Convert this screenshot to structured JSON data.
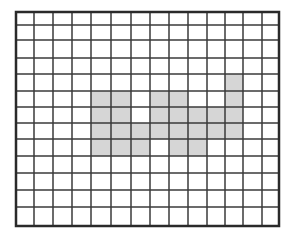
{
  "diagram": {
    "type": "grid",
    "columns": 14,
    "rows": 13,
    "x_lines": [
      16,
      34,
      53,
      72,
      91,
      111,
      131,
      150,
      169,
      188,
      207,
      225,
      243,
      262,
      279
    ],
    "y_lines": [
      12,
      25,
      40,
      58,
      74,
      91,
      107,
      123,
      139,
      156,
      173,
      190,
      207,
      226
    ],
    "line_color": "#3a3a3a",
    "border_color": "#2a2a2a",
    "fill_color": "#d6d6d6",
    "background": "#ffffff",
    "shaded_cells": [
      [
        4,
        11
      ],
      [
        5,
        4
      ],
      [
        5,
        5
      ],
      [
        5,
        7
      ],
      [
        5,
        8
      ],
      [
        5,
        11
      ],
      [
        6,
        4
      ],
      [
        6,
        5
      ],
      [
        6,
        7
      ],
      [
        6,
        8
      ],
      [
        6,
        9
      ],
      [
        6,
        10
      ],
      [
        6,
        11
      ],
      [
        7,
        4
      ],
      [
        7,
        5
      ],
      [
        7,
        6
      ],
      [
        7,
        7
      ],
      [
        7,
        8
      ],
      [
        7,
        9
      ],
      [
        7,
        10
      ],
      [
        7,
        11
      ],
      [
        8,
        4
      ],
      [
        8,
        5
      ],
      [
        8,
        6
      ],
      [
        8,
        8
      ],
      [
        8,
        9
      ]
    ]
  }
}
